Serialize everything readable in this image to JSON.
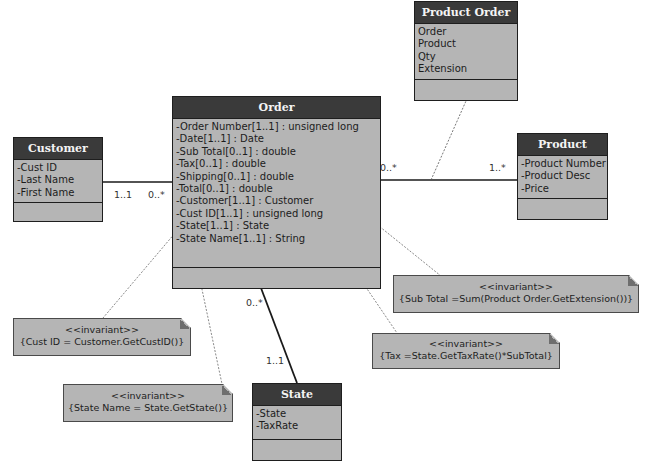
{
  "diagram": {
    "type": "UML class diagram",
    "classes": {
      "order": {
        "name": "Order",
        "attributes": [
          "-Order Number[1..1] : unsigned long",
          "-Date[1..1] : Date",
          "-Sub Total[0..1] : double",
          "-Tax[0..1] : double",
          "-Shipping[0..1] : double",
          "-Total[0..1] : double",
          "-Customer[1..1] : Customer",
          "-Cust ID[1..1] : unsigned long",
          "-State[1..1] : State",
          "-State Name[1..1] : String"
        ]
      },
      "customer": {
        "name": "Customer",
        "attributes": [
          "-Cust ID",
          "-Last Name",
          "-First Name"
        ]
      },
      "product_order": {
        "name": "Product Order",
        "attributes": [
          "Order",
          "Product",
          "Qty",
          "Extension"
        ]
      },
      "product": {
        "name": "Product",
        "attributes": [
          "-Product Number",
          "-Product Desc",
          "-Price"
        ]
      },
      "state": {
        "name": "State",
        "attributes": [
          "-State",
          "-TaxRate"
        ]
      }
    },
    "multiplicities": {
      "customer_end": "1..1",
      "order_customer_end": "0..*",
      "order_product_end": "0..*",
      "product_end": "1..*",
      "order_state_end": "0..*",
      "state_end": "1..1"
    },
    "notes": {
      "subtotal": {
        "stereotype": "<<invariant>>",
        "constraint": "{Sub Total =Sum(Product Order.GetExtension())}"
      },
      "tax": {
        "stereotype": "<<invariant>>",
        "constraint": "{Tax =State.GetTaxRate()*SubTotal}"
      },
      "custid": {
        "stereotype": "<<invariant>>",
        "constraint": "{Cust ID = Customer.GetCustID()}"
      },
      "statename": {
        "stereotype": "<<invariant>>",
        "constraint": "{State Name = State.GetState()}"
      }
    },
    "colors": {
      "header": "#3a3a3a",
      "body": "#b5b5b5",
      "border": "#1e1e1e"
    }
  }
}
